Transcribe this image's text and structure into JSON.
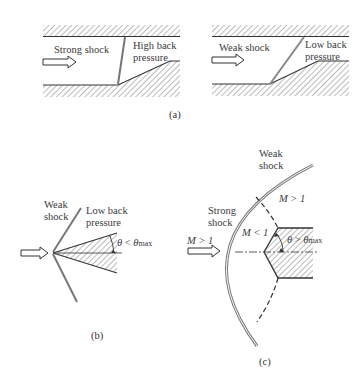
{
  "panels": {
    "a": {
      "caption": "(a)",
      "left": {
        "shock_label": "Strong shock",
        "back_pressure_line1": "High back",
        "back_pressure_line2": "pressure"
      },
      "right": {
        "shock_label": "Weak shock",
        "back_pressure_line1": "Low back",
        "back_pressure_line2": "pressure"
      }
    },
    "b": {
      "caption": "(b)",
      "shock_line1": "Weak",
      "shock_line2": "shock",
      "back_pressure_line1": "Low back",
      "back_pressure_line2": "pressure",
      "angle_theta": "θ",
      "angle_relation": " < ",
      "angle_theta_max": "θ",
      "angle_max_sub": "max"
    },
    "c": {
      "caption": "(c)",
      "weak_shock_line1": "Weak",
      "weak_shock_line2": "shock",
      "strong_shock_line1": "Strong",
      "strong_shock_line2": "shock",
      "freestream_mach": "M > 1",
      "outer_region_mach": "M > 1",
      "subsonic_region_mach": "M < 1",
      "angle_theta": "θ",
      "angle_relation": " > ",
      "angle_theta_max": "θ",
      "angle_max_sub": "max"
    }
  },
  "colors": {
    "line": "#333333",
    "shock": "#777777",
    "hatch": "#555555",
    "background": "#ffffff"
  }
}
